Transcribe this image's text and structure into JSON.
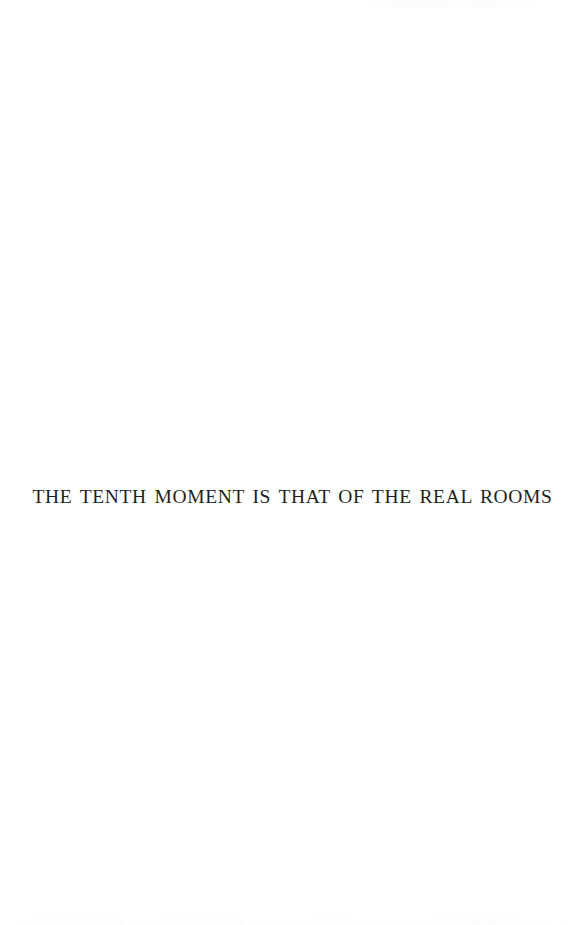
{
  "page": {
    "kind": "scanned-book-page",
    "background_color": "#ffffff",
    "width": 580,
    "height": 925
  },
  "body": {
    "section_title": "THE TENTH MOMENT IS THAT OF THE REAL ROOMS",
    "title_color": "#211f22"
  }
}
